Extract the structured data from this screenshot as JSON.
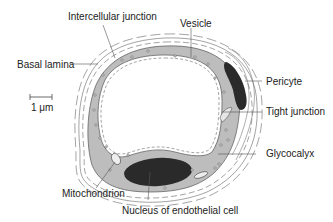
{
  "labels": {
    "intercellular_junction": "Intercellular junction",
    "vesicle": "Vesicle",
    "basal_lamina": "Basal lamina",
    "pericyte": "Pericyte",
    "tight_junction": "Tight junction",
    "glycocalyx": "Glycocalyx",
    "mitochondrion": "Mitochondrion",
    "nucleus": "Nucleus of endothelial cell"
  },
  "scale_bar": {
    "label": "1 μm"
  },
  "colors": {
    "cytoplasm": "#bdbdbd",
    "nucleus": "#2a2a2a",
    "outline": "#555555",
    "background": "#ffffff"
  }
}
